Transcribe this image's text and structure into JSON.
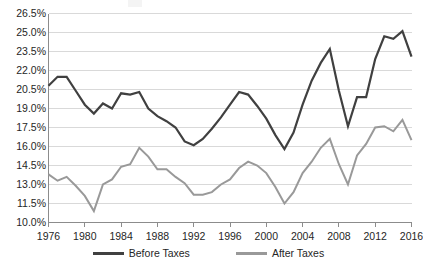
{
  "chart_data": {
    "type": "line",
    "title": "",
    "subtitle": "",
    "xlabel": "",
    "ylabel": "",
    "x": [
      1976,
      1977,
      1978,
      1979,
      1980,
      1981,
      1982,
      1983,
      1984,
      1985,
      1986,
      1987,
      1988,
      1989,
      1990,
      1991,
      1992,
      1993,
      1994,
      1995,
      1996,
      1997,
      1998,
      1999,
      2000,
      2001,
      2002,
      2003,
      2004,
      2005,
      2006,
      2007,
      2008,
      2009,
      2010,
      2011,
      2012,
      2013,
      2014,
      2015,
      2016
    ],
    "series": [
      {
        "name": "Before Taxes",
        "color": "#404040",
        "values": [
          20.8,
          21.5,
          21.5,
          20.4,
          19.3,
          18.6,
          19.4,
          19.0,
          20.2,
          20.1,
          20.3,
          19.0,
          18.4,
          18.0,
          17.5,
          16.4,
          16.1,
          16.6,
          17.4,
          18.3,
          19.3,
          20.3,
          20.1,
          19.2,
          18.2,
          16.9,
          15.8,
          17.1,
          19.3,
          21.2,
          22.6,
          23.7,
          20.4,
          17.6,
          19.9,
          19.9,
          22.9,
          24.7,
          24.5,
          25.1,
          23.1
        ],
        "marker": "none",
        "linewidth": 2.2
      },
      {
        "name": "After Taxes",
        "color": "#999999",
        "values": [
          13.8,
          13.3,
          13.6,
          12.9,
          12.1,
          10.9,
          13.0,
          13.4,
          14.4,
          14.6,
          15.9,
          15.2,
          14.2,
          14.2,
          13.6,
          13.1,
          12.2,
          12.2,
          12.4,
          13.0,
          13.4,
          14.3,
          14.8,
          14.5,
          13.9,
          12.8,
          11.5,
          12.4,
          13.9,
          14.8,
          15.9,
          16.6,
          14.6,
          13.0,
          15.3,
          16.2,
          17.5,
          17.6,
          17.2,
          18.1,
          16.5
        ]
      }
    ],
    "xlim": [
      1976,
      2016
    ],
    "ylim": [
      10.0,
      26.5
    ],
    "ytick_values": [
      10.0,
      11.5,
      13.0,
      14.5,
      16.0,
      17.5,
      19.0,
      20.5,
      22.0,
      23.5,
      25.0,
      26.5
    ],
    "ytick_labels": [
      "10.0%",
      "11.5%",
      "13.0%",
      "14.5%",
      "16.0%",
      "17.5%",
      "19.0%",
      "20.5%",
      "22.0%",
      "23.5%",
      "25.0%",
      "26.5%"
    ],
    "xtick_values": [
      1976,
      1980,
      1984,
      1988,
      1992,
      1996,
      2000,
      2004,
      2008,
      2012,
      2016
    ],
    "xtick_labels": [
      "1976",
      "1980",
      "1984",
      "1988",
      "1992",
      "1996",
      "2000",
      "2004",
      "2008",
      "2012",
      "2016"
    ],
    "grid": {
      "horizontal": true,
      "vertical": false,
      "color": "#d9d9d9"
    },
    "legend": {
      "position": "bottom",
      "entries": [
        {
          "label": "Before Taxes",
          "color": "#404040"
        },
        {
          "label": "After Taxes",
          "color": "#999999"
        }
      ]
    },
    "axis_color": "#8c8c8c",
    "text_color": "#262626",
    "background": "#ffffff"
  }
}
